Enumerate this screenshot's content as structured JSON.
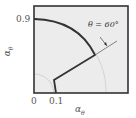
{
  "diagram": {
    "y_tick_label": "0.9",
    "x_tick_labels": [
      "0",
      "0.1"
    ],
    "x_axis_label": "α",
    "x_axis_sub": "θ",
    "y_axis_label": "α",
    "y_axis_sub": "θ",
    "annotation": "θ = 60°",
    "colors": {
      "background": "#ececec",
      "frame": "#333333",
      "curve": "#333333",
      "guide": "#bbbbbb"
    }
  }
}
